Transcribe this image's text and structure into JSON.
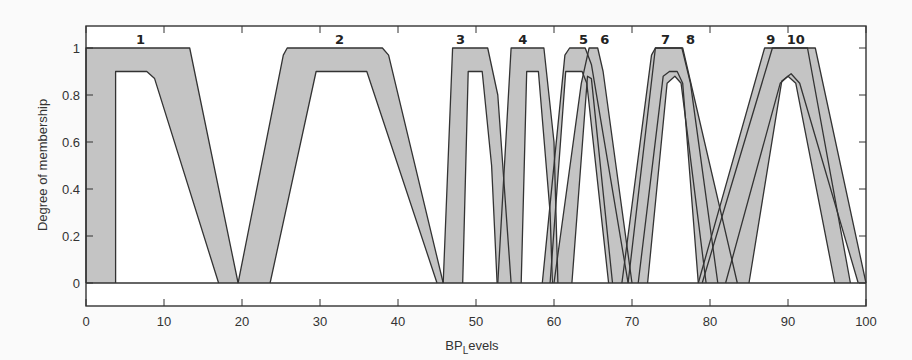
{
  "chart_data": {
    "type": "area",
    "title": "",
    "xlabel": "BP Levels",
    "xlabel_main": "BP",
    "xlabel_sub": "L",
    "xlabel_rest": "evels",
    "ylabel": "Degree of membership",
    "xlim": [
      0,
      100
    ],
    "ylim": [
      -0.1,
      1.1
    ],
    "xticks": [
      0,
      10,
      20,
      30,
      40,
      50,
      60,
      70,
      80,
      90,
      100
    ],
    "yticks": [
      0,
      0.2,
      0.4,
      0.6,
      0.8,
      1
    ],
    "ytick_labels": [
      "0",
      "0.2",
      "0.4",
      "0.6",
      "0.8",
      "1"
    ],
    "grid": false,
    "legend": "none",
    "fill_color": "#c4c4c4",
    "line_color": "#333333",
    "series": [
      {
        "name": "1",
        "label_x": 7,
        "upper": [
          [
            0,
            0
          ],
          [
            0,
            1
          ],
          [
            13.3,
            1
          ],
          [
            19.5,
            0
          ]
        ],
        "lower": [
          [
            3.8,
            0
          ],
          [
            3.8,
            0.9
          ],
          [
            7.8,
            0.9
          ],
          [
            8.8,
            0.87
          ],
          [
            17,
            0
          ]
        ]
      },
      {
        "name": "2",
        "label_x": 32.5,
        "upper": [
          [
            19.5,
            0
          ],
          [
            25.3,
            0.97
          ],
          [
            25.8,
            1
          ],
          [
            38,
            1
          ],
          [
            38.8,
            0.97
          ],
          [
            45.8,
            0
          ]
        ],
        "lower": [
          [
            23.6,
            0
          ],
          [
            29.5,
            0.9
          ],
          [
            36,
            0.9
          ],
          [
            45,
            0
          ]
        ]
      },
      {
        "name": "3",
        "label_x": 48,
        "upper": [
          [
            45.8,
            0
          ],
          [
            47,
            1
          ],
          [
            51.5,
            1
          ],
          [
            52.8,
            0.8
          ],
          [
            54.5,
            0
          ]
        ],
        "lower": [
          [
            48.3,
            0
          ],
          [
            49,
            0.9
          ],
          [
            50.8,
            0.9
          ],
          [
            52,
            0.5
          ],
          [
            52.7,
            0
          ]
        ]
      },
      {
        "name": "4",
        "label_x": 56,
        "upper": [
          [
            52.8,
            0
          ],
          [
            54.5,
            1
          ],
          [
            58.7,
            1
          ],
          [
            60,
            0.6
          ],
          [
            60.5,
            0
          ]
        ],
        "lower": [
          [
            55.8,
            0
          ],
          [
            56.5,
            0.9
          ],
          [
            58,
            0.9
          ],
          [
            59.5,
            0.3
          ],
          [
            59.8,
            0
          ]
        ]
      },
      {
        "name": "5",
        "label_x": 63.8,
        "upper": [
          [
            58.5,
            0
          ],
          [
            61.4,
            0.97
          ],
          [
            62,
            1
          ],
          [
            64,
            1
          ],
          [
            64.8,
            0.93
          ],
          [
            69.5,
            0
          ]
        ],
        "lower": [
          [
            59.5,
            0
          ],
          [
            61.5,
            0.9
          ],
          [
            63.6,
            0.9
          ],
          [
            64.2,
            0.85
          ],
          [
            67,
            0
          ]
        ]
      },
      {
        "name": "6",
        "label_x": 66.5,
        "upper": [
          [
            60,
            0
          ],
          [
            63.5,
            0.85
          ],
          [
            64.5,
            1
          ],
          [
            65.6,
            1
          ],
          [
            66.3,
            0.9
          ],
          [
            70,
            0
          ]
        ],
        "lower": [
          [
            62.3,
            0
          ],
          [
            64.3,
            0.88
          ],
          [
            64.8,
            0.87
          ],
          [
            67.5,
            0
          ]
        ]
      },
      {
        "name": "7",
        "label_x": 74.3,
        "upper": [
          [
            68.7,
            0
          ],
          [
            72.5,
            0.97
          ],
          [
            73,
            1
          ],
          [
            76.4,
            1
          ],
          [
            77.5,
            0.85
          ],
          [
            81,
            0
          ]
        ],
        "lower": [
          [
            70.8,
            0
          ],
          [
            74,
            0.88
          ],
          [
            74.8,
            0.9
          ],
          [
            75.8,
            0.9
          ],
          [
            76.5,
            0.85
          ],
          [
            78.5,
            0
          ]
        ]
      },
      {
        "name": "8",
        "label_x": 77.5,
        "upper": [
          [
            69.5,
            0
          ],
          [
            73,
            1
          ],
          [
            76.5,
            1
          ],
          [
            83.5,
            0
          ]
        ],
        "lower": [
          [
            72,
            0
          ],
          [
            74.5,
            0.85
          ],
          [
            75.5,
            0.88
          ],
          [
            76.3,
            0.85
          ],
          [
            79.5,
            0
          ]
        ]
      },
      {
        "name": "9",
        "label_x": 87.8,
        "upper": [
          [
            78.5,
            0
          ],
          [
            87,
            1
          ],
          [
            92.5,
            1
          ],
          [
            98,
            0
          ]
        ],
        "lower": [
          [
            82,
            0
          ],
          [
            89,
            0.85
          ],
          [
            90,
            0.88
          ],
          [
            91,
            0.85
          ],
          [
            96,
            0
          ]
        ]
      },
      {
        "name": "10",
        "label_x": 91,
        "upper": [
          [
            79,
            0
          ],
          [
            88,
            1
          ],
          [
            93.5,
            1
          ],
          [
            100,
            0
          ]
        ],
        "lower": [
          [
            85,
            0
          ],
          [
            89.2,
            0.86
          ],
          [
            90.4,
            0.89
          ],
          [
            91.5,
            0.85
          ],
          [
            99,
            0
          ]
        ]
      }
    ]
  }
}
